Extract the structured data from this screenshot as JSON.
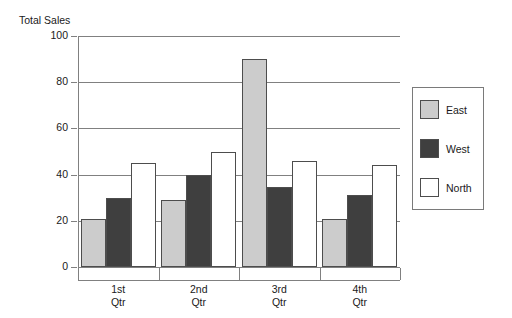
{
  "figure": {
    "axis_title": "Total Sales"
  },
  "legend": {
    "position": "right",
    "entries": [
      {
        "label": "East",
        "color": "#cccccc",
        "swatch": "east"
      },
      {
        "label": "West",
        "color": "#3f3f3f",
        "swatch": "west"
      },
      {
        "label": "North",
        "color": "#ffffff",
        "swatch": "north"
      }
    ]
  },
  "axes": {
    "y_ticks": [
      "0",
      "20",
      "40",
      "60",
      "80",
      "100"
    ],
    "x_categories": [
      {
        "line1": "1st",
        "line2": "Qtr"
      },
      {
        "line1": "2nd",
        "line2": "Qtr"
      },
      {
        "line1": "3rd",
        "line2": "Qtr"
      },
      {
        "line1": "4th",
        "line2": "Qtr"
      }
    ]
  },
  "chart_data": {
    "type": "bar",
    "title": "",
    "xlabel": "",
    "ylabel": "Total Sales",
    "ylim": [
      0,
      100
    ],
    "ytick_step": 20,
    "grid": true,
    "legend_position": "right",
    "categories": [
      "1st Qtr",
      "2nd Qtr",
      "3rd Qtr",
      "4th Qtr"
    ],
    "series": [
      {
        "name": "East",
        "color": "#cccccc",
        "values": [
          21,
          29,
          90,
          21
        ]
      },
      {
        "name": "West",
        "color": "#3f3f3f",
        "values": [
          30,
          40,
          34.5,
          31
        ]
      },
      {
        "name": "North",
        "color": "#ffffff",
        "values": [
          45,
          50,
          46,
          44
        ]
      }
    ]
  }
}
